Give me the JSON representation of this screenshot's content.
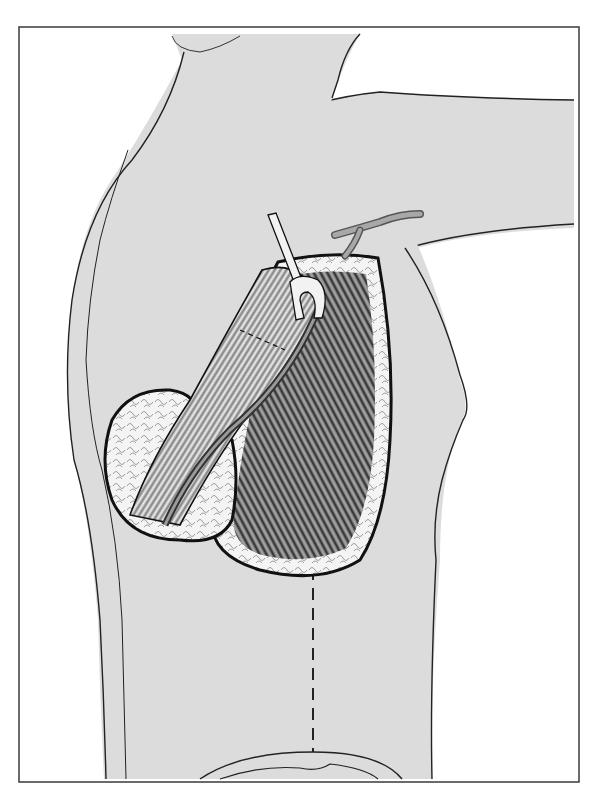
{
  "figure": {
    "colors": {
      "background": "#ffffff",
      "frame": "#3a3a3a",
      "skin": "#dcdcdc",
      "outline": "#222222",
      "fat": "#f4f4f4",
      "muscle_dark": "#2a2a2a",
      "muscle_light": "#bdbdbd",
      "vessel": "#9a9a9a",
      "retractor": "#f2f2f2"
    },
    "elements": {
      "frame": "border frame",
      "body": "torso outline",
      "arm": "abducted arm",
      "retractor": "surgical retractor",
      "vessel": "axillary vessel",
      "incision_pocket": "dissected pocket",
      "flap": "elevated muscle flap",
      "fat_pad": "subcutaneous fat",
      "pedicle": "vascular pedicle",
      "incision_line": "dashed incision line",
      "umbilicus_area": "lower abdominal contour"
    }
  }
}
